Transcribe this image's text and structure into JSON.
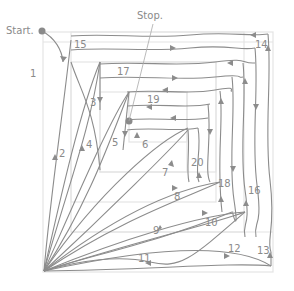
{
  "labels": {
    "start": "Start.",
    "stop": "Stop."
  },
  "steps": [
    {
      "n": "1",
      "x": 30,
      "y": 77
    },
    {
      "n": "2",
      "x": 55,
      "y": 154
    },
    {
      "n": "3",
      "x": 90,
      "y": 104
    },
    {
      "n": "4",
      "x": 84,
      "y": 145
    },
    {
      "n": "5",
      "x": 112,
      "y": 144
    },
    {
      "n": "6",
      "x": 142,
      "y": 146
    },
    {
      "n": "7",
      "x": 162,
      "y": 175
    },
    {
      "n": "8",
      "x": 174,
      "y": 199
    },
    {
      "n": "9",
      "x": 153,
      "y": 233
    },
    {
      "n": "10",
      "x": 206,
      "y": 225
    },
    {
      "n": "11",
      "x": 140,
      "y": 262
    },
    {
      "n": "12",
      "x": 228,
      "y": 251
    },
    {
      "n": "13",
      "x": 257,
      "y": 254
    },
    {
      "n": "14",
      "x": 255,
      "y": 47
    },
    {
      "n": "15",
      "x": 74,
      "y": 47
    },
    {
      "n": "16",
      "x": 248,
      "y": 194
    },
    {
      "n": "17",
      "x": 117,
      "y": 74
    },
    {
      "n": "18",
      "x": 218,
      "y": 187
    },
    {
      "n": "19",
      "x": 147,
      "y": 102
    },
    {
      "n": "20",
      "x": 191,
      "y": 165
    }
  ],
  "colors": {
    "line": "#8c8c8c",
    "grid": "#e4e4e4",
    "text": "#8a8a8a",
    "dot": "#8a8a8a"
  }
}
